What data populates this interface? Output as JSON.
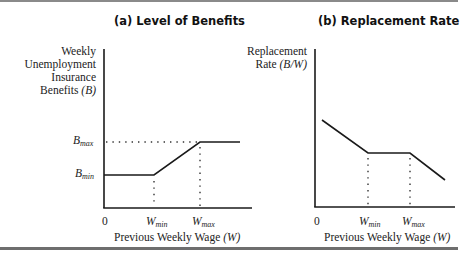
{
  "panel_a": {
    "title": "(a) Level of Benefits",
    "ylabel_lines": [
      "Weekly",
      "Unemployment",
      "Insurance",
      "Benefits"
    ],
    "ylabel_var": "(B)",
    "y_ticks": [
      {
        "base": "B",
        "sub": "max"
      },
      {
        "base": "B",
        "sub": "min"
      }
    ],
    "x_ticks": [
      {
        "base": "0",
        "sub": ""
      },
      {
        "base": "W",
        "sub": "min"
      },
      {
        "base": "W",
        "sub": "max"
      }
    ],
    "xlabel": "Previous Weekly Wage",
    "xlabel_var": "(W)"
  },
  "panel_b": {
    "title": "(b) Replacement Rate",
    "ylabel_lines": [
      "Replacement",
      "Rate"
    ],
    "ylabel_var": "(B/W)",
    "x_ticks": [
      {
        "base": "0",
        "sub": ""
      },
      {
        "base": "W",
        "sub": "min"
      },
      {
        "base": "W",
        "sub": "max"
      }
    ],
    "xlabel": "Previous Weekly Wage",
    "xlabel_var": "(W)"
  },
  "colors": {
    "line": "#1a1a1a",
    "rule": "#7a7a7a"
  }
}
